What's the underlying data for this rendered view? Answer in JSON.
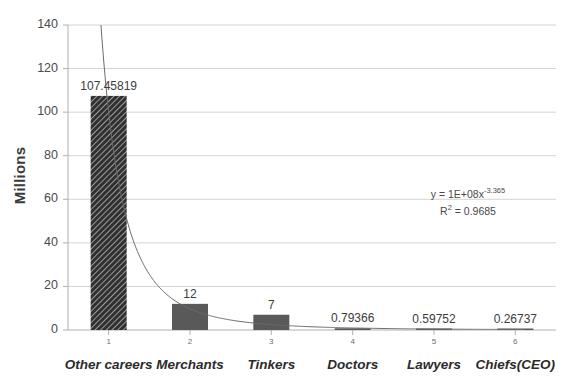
{
  "chart_data": {
    "type": "bar",
    "title": "",
    "xlabel": "",
    "ylabel": "Millions",
    "categories": [
      "Other careers",
      "Merchants",
      "Tinkers",
      "Doctors",
      "Lawyers",
      "Chiefs(CEO)"
    ],
    "x": [
      1,
      2,
      3,
      4,
      5,
      6
    ],
    "values": [
      107.45819,
      12,
      7,
      0.79366,
      0.59752,
      0.26737
    ],
    "value_labels": [
      "107.45819",
      "12",
      "7",
      "0.79366",
      "0.59752",
      "0.26737"
    ],
    "ylim": [
      0,
      140
    ],
    "yticks": [
      0,
      20,
      40,
      60,
      80,
      100,
      120,
      140
    ],
    "ytick_labels": [
      "0",
      "20",
      "40",
      "60",
      "80",
      "100",
      "120",
      "140"
    ],
    "xtick_labels": [
      "1",
      "2",
      "3",
      "4",
      "5",
      "6"
    ],
    "grid": "horizontal",
    "legend": "none",
    "trendline": {
      "type": "power",
      "equation": "y = 1E+08x",
      "equation_exponent": "-3.365",
      "r_squared_label": "R",
      "r_squared_sup": "2",
      "r_squared_value": "= 0.9685",
      "coefficient": 100000000,
      "exponent": -3.365,
      "r2": 0.9685
    },
    "colors": {
      "bar_primary": "#3f3f3f",
      "bar_secondary": "#595959",
      "gridline": "#d4d4d4",
      "axis": "#b0b0b0",
      "trendline": "#6b6b6b",
      "text": "#3c3c3c",
      "background": "#ffffff"
    }
  }
}
